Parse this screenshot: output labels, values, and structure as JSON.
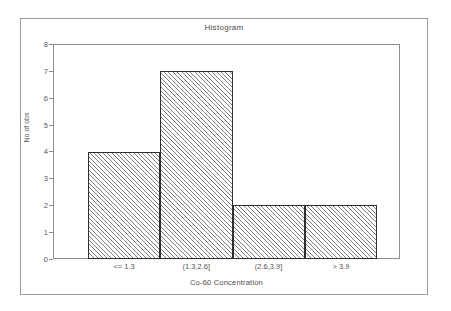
{
  "chart_data": {
    "type": "bar",
    "title": "Histogram",
    "xlabel": "Co-60 Concentration",
    "ylabel": "No of obs",
    "categories": [
      "<= 1.3",
      "(1.3,2.6]",
      "(2.6,3.9]",
      "> 3.9"
    ],
    "values": [
      4,
      7,
      2,
      2
    ],
    "ylim": [
      0,
      8
    ],
    "yticks": [
      "0",
      "1",
      "2",
      "3",
      "4",
      "5",
      "6",
      "7",
      "8"
    ],
    "ytick_values": [
      0,
      1,
      2,
      3,
      4,
      5,
      6,
      7,
      8
    ],
    "grid": false,
    "legend": false,
    "bar_fill": "diagonal-hatch",
    "bar_edge_color": "#2e2e2e",
    "hatch_color": "#7e7e7e",
    "frame_color": "#8d8d8d",
    "outer_border_color": "#9a9a9a",
    "text_color": "#555555",
    "background": "#ffffff"
  }
}
